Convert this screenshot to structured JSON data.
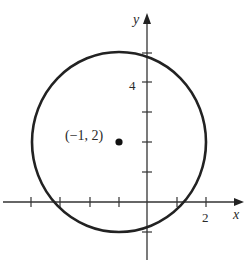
{
  "figure": {
    "axes": {
      "x_label": "x",
      "y_label": "y",
      "x_tick_label": "2",
      "y_tick_label": "4"
    },
    "point": {
      "label": "(−1, 2)",
      "x": -1,
      "y": 2
    },
    "colors": {
      "stroke": "#222222",
      "background": "#ffffff"
    }
  }
}
